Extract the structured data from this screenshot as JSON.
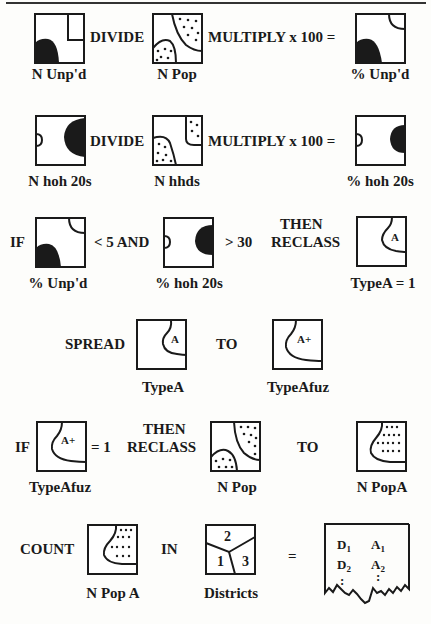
{
  "rows": [
    {
      "id": "row1",
      "ops": [
        "DIVIDE",
        "MULTIPLY x 100 ="
      ],
      "labels": [
        "N Unp'd",
        "N Pop",
        "% Unp'd"
      ]
    },
    {
      "id": "row2",
      "ops": [
        "DIVIDE",
        "MULTIPLY x 100 ="
      ],
      "labels": [
        "N hoh 20s",
        "N hhds",
        "% hoh 20s"
      ]
    },
    {
      "id": "row3",
      "ops": [
        "IF",
        "< 5  AND",
        "> 30",
        "THEN",
        "RECLASS"
      ],
      "labels": [
        "% Unp'd",
        "% hoh 20s",
        "TypeA = 1"
      ],
      "map_text": "A"
    },
    {
      "id": "row4",
      "ops": [
        "SPREAD",
        "TO"
      ],
      "labels": [
        "TypeA",
        "TypeAfuz"
      ],
      "map_text": [
        "A",
        "A+"
      ]
    },
    {
      "id": "row5",
      "ops": [
        "IF",
        "= 1",
        "THEN",
        "RECLASS",
        "TO"
      ],
      "labels": [
        "TypeAfuz",
        "N Pop",
        "N PopA"
      ],
      "map_text": "A+"
    },
    {
      "id": "row6",
      "ops": [
        "COUNT",
        "IN",
        "="
      ],
      "labels": [
        "N Pop A",
        "Districts"
      ],
      "district_numbers": [
        "2",
        "1",
        "3"
      ],
      "table": {
        "col1": [
          "D",
          "D"
        ],
        "col2": [
          "A",
          "A"
        ],
        "subscripts": [
          "1",
          "2"
        ],
        "continuation": ":"
      }
    }
  ]
}
